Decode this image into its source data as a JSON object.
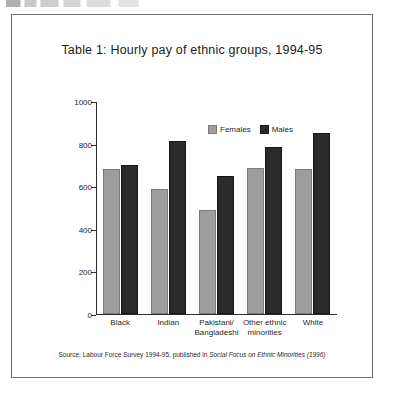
{
  "scan": {
    "top_remnant": ""
  },
  "figure": {
    "title": "Table 1: Hourly pay of ethnic groups, 1994-95",
    "source_prefix": "Source: Labour Force Survey 1994-95, published in ",
    "source_italic": "Social Focus on Ethnic Minorities",
    "source_suffix": " (1996)"
  },
  "legend": {
    "position": "inside-top-right",
    "items": [
      {
        "label": "Females",
        "color": "#9d9d9d"
      },
      {
        "label": "Males",
        "color": "#2b2b2b"
      }
    ]
  },
  "axis": {
    "y_ticks": [
      "0",
      "200",
      "400",
      "600",
      "800",
      "1000"
    ],
    "y_values": [
      0,
      200,
      400,
      600,
      800,
      1000
    ]
  },
  "categories_display": [
    [
      "Black"
    ],
    [
      "Indian"
    ],
    [
      "Pakistani/",
      "Bangladeshi"
    ],
    [
      "Other ethnic",
      "minorities"
    ],
    [
      "White"
    ]
  ],
  "chart_data": {
    "type": "bar",
    "title": "Table 1: Hourly pay of ethnic groups, 1994-95",
    "xlabel": "",
    "ylabel": "",
    "ylim": [
      0,
      1000
    ],
    "ytick_step": 200,
    "grid": false,
    "legend_position": "inside-top-right",
    "categories": [
      "Black",
      "Indian",
      "Pakistani/Bangladeshi",
      "Other ethnic minorities",
      "White"
    ],
    "series": [
      {
        "name": "Females",
        "color": "#9d9d9d",
        "values": [
          680,
          585,
          490,
          685,
          680
        ]
      },
      {
        "name": "Males",
        "color": "#2b2b2b",
        "values": [
          700,
          810,
          650,
          785,
          850
        ]
      }
    ],
    "annotations": [
      "Source: Labour Force Survey 1994-95, published in Social Focus on Ethnic Minorities (1996)"
    ]
  }
}
